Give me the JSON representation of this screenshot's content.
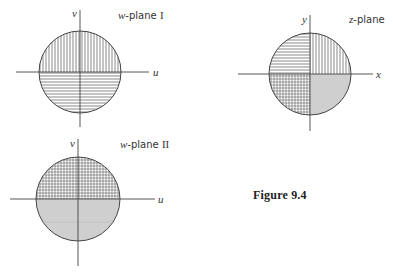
{
  "figure": {
    "caption": "Figure 9.4",
    "colors": {
      "line": "#444444",
      "hatch": "#555555",
      "shaded": "#cfcfcf",
      "background": "#ffffff"
    }
  },
  "panels": {
    "w_plane_1": {
      "title_var": "w",
      "title_rest": "-plane ",
      "title_numeral": "I",
      "x_axis_label": "u",
      "y_axis_label": "v",
      "regions": {
        "upper_half": "vertical-hatch",
        "lower_half": "horizontal-hatch"
      }
    },
    "z_plane": {
      "title_var": "z",
      "title_rest": "-plane",
      "x_axis_label": "x",
      "y_axis_label": "y",
      "regions": {
        "quadrant_1": "vertical-hatch",
        "quadrant_2": "horizontal-hatch",
        "quadrant_3": "cross-hatch",
        "quadrant_4": "gray-shaded"
      }
    },
    "w_plane_2": {
      "title_var": "w",
      "title_rest": "-plane ",
      "title_numeral": "II",
      "x_axis_label": "u",
      "y_axis_label": "v",
      "regions": {
        "upper_half": "cross-hatch",
        "lower_half": "gray-shaded"
      }
    }
  }
}
